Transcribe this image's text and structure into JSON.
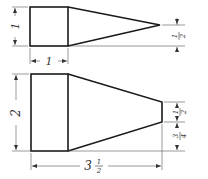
{
  "figures": [
    {
      "name": "pyramid-top-view",
      "shape": "square-with-triangular-point",
      "dimensions": {
        "height": "1",
        "width": "1",
        "apex_offset": "1/2"
      }
    },
    {
      "name": "frustum-side-view",
      "shape": "rectangle-with-trapezoidal-taper",
      "dimensions": {
        "height": "2",
        "overall_length": "3 1/2",
        "tip_height": "1/2",
        "tip_offset": "3/4"
      }
    }
  ],
  "labels": {
    "top_height": "1",
    "top_width": "1",
    "top_apex_num": "1",
    "top_apex_den": "2",
    "bottom_height": "2",
    "bottom_length_whole": "3",
    "bottom_length_num": "1",
    "bottom_length_den": "2",
    "bottom_tip_num": "1",
    "bottom_tip_den": "2",
    "bottom_offset_num": "3",
    "bottom_offset_den": "4"
  }
}
